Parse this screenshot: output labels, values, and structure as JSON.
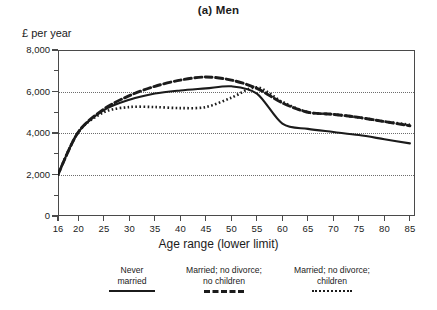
{
  "title": "(a) Men",
  "y_axis_label": "£ per year",
  "x_axis_label": "Age range (lower limit)",
  "y_tick_labels": [
    "8,000",
    "6,000",
    "4,000",
    "2,000",
    "0"
  ],
  "x_tick_labels": [
    "16",
    "20",
    "25",
    "30",
    "35",
    "40",
    "45",
    "50",
    "55",
    "60",
    "65",
    "70",
    "75",
    "80",
    "85"
  ],
  "legend": {
    "items": [
      {
        "line1": "Never",
        "line2": "married",
        "style": "solid"
      },
      {
        "line1": "Married; no divorce;",
        "line2": "no children",
        "style": "dashed"
      },
      {
        "line1": "Married; no divorce;",
        "line2": "children",
        "style": "dotted"
      }
    ]
  },
  "colors": {
    "line": "#1b1b1b",
    "axis": "#4a4a4a",
    "grid": "#6d6d6d",
    "background": "#ffffff"
  },
  "chart_data": {
    "type": "line",
    "title": "(a) Men",
    "xlabel": "Age range (lower limit)",
    "ylabel": "£ per year",
    "xlim": [
      16,
      86
    ],
    "ylim": [
      0,
      8000
    ],
    "yticks": [
      0,
      2000,
      4000,
      6000,
      8000
    ],
    "xticks": [
      16,
      20,
      25,
      30,
      35,
      40,
      45,
      50,
      55,
      60,
      65,
      70,
      75,
      80,
      85
    ],
    "grid": "horizontal-dotted",
    "legend_position": "below-axes",
    "x": [
      16,
      20,
      25,
      30,
      35,
      40,
      45,
      50,
      55,
      60,
      65,
      70,
      75,
      80,
      85
    ],
    "series": [
      {
        "name": "Never married",
        "style": "solid",
        "values": [
          2000,
          4050,
          5100,
          5600,
          5900,
          6050,
          6150,
          6250,
          5900,
          4450,
          4200,
          4050,
          3900,
          3700,
          3500
        ]
      },
      {
        "name": "Married; no divorce; no children",
        "style": "dashed",
        "values": [
          2000,
          4050,
          5150,
          5800,
          6250,
          6550,
          6700,
          6550,
          6150,
          5450,
          5000,
          4900,
          4750,
          4550,
          4350
        ]
      },
      {
        "name": "Married; no divorce; children",
        "style": "dotted",
        "values": [
          2000,
          4050,
          5000,
          5250,
          5250,
          5200,
          5250,
          5700,
          6200,
          5500,
          5000,
          4900,
          4750,
          4550,
          4400
        ]
      }
    ]
  }
}
